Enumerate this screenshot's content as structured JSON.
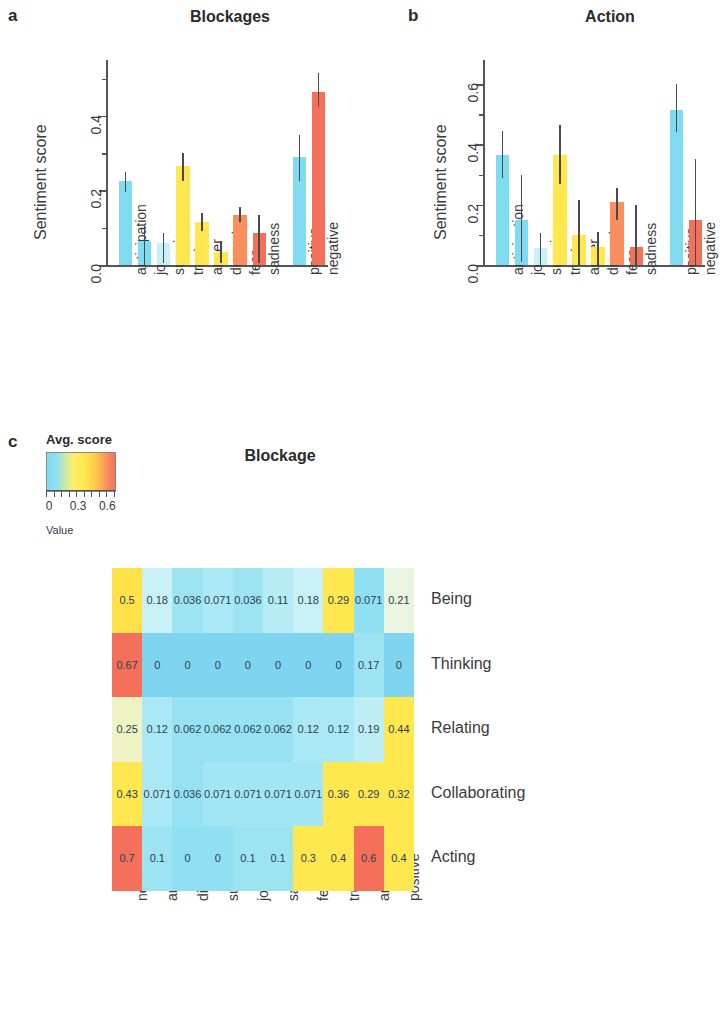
{
  "figure": {
    "panels": [
      {
        "letter": "a",
        "title": "Blockages"
      },
      {
        "letter": "b",
        "title": "Action"
      },
      {
        "letter": "c",
        "title": "Blockage"
      }
    ]
  },
  "panel_a": {
    "letter": "a",
    "title": "Blockages",
    "ylabel": "Sentiment score",
    "yticks": [
      "0.0",
      "0.2",
      "0.4"
    ]
  },
  "panel_b": {
    "letter": "b",
    "title": "Action",
    "ylabel": "Sentiment score",
    "yticks": [
      "0.0",
      "0.2",
      "0.4",
      "0.6"
    ]
  },
  "panel_c": {
    "letter": "c",
    "title": "Blockage",
    "legend": {
      "title": "Avg. score",
      "value_label": "Value",
      "ticks": [
        "0",
        "0.3",
        "0.6"
      ]
    },
    "colors": {
      "cyan": "#7fdcf0",
      "pale_cyan": "#c9f0f7",
      "yellow": "#ffe84f",
      "pale_yellow": "#f2f7c8",
      "orange": "#fa8e5e",
      "red": "#f4705a"
    }
  },
  "chart_data": [
    {
      "type": "bar",
      "panel": "a",
      "title": "Blockages",
      "xlabel": "",
      "ylabel": "Sentiment score",
      "ylim": [
        0,
        0.55
      ],
      "yticks": [
        0.0,
        0.2,
        0.4
      ],
      "grid": false,
      "legend": "none",
      "categories": [
        "anticipation",
        "joy",
        "surprise",
        "trust",
        "anger",
        "disgust",
        "fear",
        "sadness",
        "positive",
        "negative"
      ],
      "values": [
        0.225,
        0.065,
        0.06,
        0.265,
        0.115,
        0.035,
        0.135,
        0.085,
        0.29,
        0.465
      ],
      "err_low": [
        0.195,
        0.0,
        0.005,
        0.225,
        0.09,
        0.005,
        0.115,
        0.005,
        0.225,
        0.425
      ],
      "err_high": [
        0.25,
        0.105,
        0.085,
        0.3,
        0.14,
        0.065,
        0.155,
        0.135,
        0.35,
        0.515
      ],
      "bar_colors": [
        "#7fdcf0",
        "#7fdcf0",
        "#c9f0f7",
        "#ffe84f",
        "#ffe84f",
        "#ffe84f",
        "#fa8e5e",
        "#f4705a",
        "#7fdcf0",
        "#f4705a"
      ]
    },
    {
      "type": "bar",
      "panel": "b",
      "title": "Action",
      "xlabel": "",
      "ylabel": "Sentiment score",
      "ylim": [
        0,
        0.68
      ],
      "yticks": [
        0.0,
        0.2,
        0.4,
        0.6
      ],
      "grid": false,
      "legend": "none",
      "categories": [
        "anticipation",
        "joy",
        "surprise",
        "trust",
        "anger",
        "disgust",
        "fear",
        "sadness",
        "positive",
        "negative"
      ],
      "values": [
        0.365,
        0.15,
        0.055,
        0.365,
        0.1,
        0.06,
        0.21,
        0.06,
        0.515,
        0.15
      ],
      "err_low": [
        0.29,
        0.01,
        0.0,
        0.27,
        0.0,
        0.0,
        0.15,
        0.0,
        0.44,
        0.0
      ],
      "err_high": [
        0.445,
        0.3,
        0.105,
        0.465,
        0.215,
        0.11,
        0.255,
        0.2,
        0.6,
        0.35
      ],
      "bar_colors": [
        "#7fdcf0",
        "#7fdcf0",
        "#c9f0f7",
        "#ffe84f",
        "#ffe84f",
        "#ffe84f",
        "#fa8e5e",
        "#f4705a",
        "#7fdcf0",
        "#f4705a"
      ]
    },
    {
      "type": "heatmap",
      "panel": "c",
      "title": "Blockage",
      "colorbar_title": "Avg. score",
      "colorbar_label": "Value",
      "colorbar_ticks": [
        0,
        0.3,
        0.6
      ],
      "zlim": [
        0,
        0.7
      ],
      "columns": [
        "negative",
        "anger",
        "disgust",
        "surprise",
        "joy",
        "sadness",
        "fear",
        "trust",
        "anticipation",
        "positive"
      ],
      "rows": [
        "Being",
        "Thinking",
        "Relating",
        "Collaborating",
        "Acting"
      ],
      "values": [
        [
          0.5,
          0.18,
          0.036,
          0.071,
          0.036,
          0.11,
          0.18,
          0.29,
          0.071,
          0.21
        ],
        [
          0.67,
          0,
          0,
          0,
          0,
          0,
          0,
          0,
          0.17,
          0
        ],
        [
          0.25,
          0.12,
          0.062,
          0.062,
          0.062,
          0.062,
          0.12,
          0.12,
          0.19,
          0.44
        ],
        [
          0.43,
          0.071,
          0.036,
          0.071,
          0.071,
          0.071,
          0.071,
          0.36,
          0.29,
          0.32
        ],
        [
          0.7,
          0.1,
          0,
          0,
          0.1,
          0.1,
          0.3,
          0.4,
          0.6,
          0.4
        ]
      ],
      "labels": [
        [
          "0.5",
          "0.18",
          "0.036",
          "0.071",
          "0.036",
          "0.11",
          "0.18",
          "0.29",
          "0.071",
          "0.21"
        ],
        [
          "0.67",
          "0",
          "0",
          "0",
          "0",
          "0",
          "0",
          "0",
          "0.17",
          "0"
        ],
        [
          "0.25",
          "0.12",
          "0.062",
          "0.062",
          "0.062",
          "0.062",
          "0.12",
          "0.12",
          "0.19",
          "0.44"
        ],
        [
          "0.43",
          "0.071",
          "0.036",
          "0.071",
          "0.071",
          "0.071",
          "0.071",
          "0.36",
          "0.29",
          "0.32"
        ],
        [
          "0.7",
          "0.1",
          "0",
          "0",
          "0.1",
          "0.1",
          "0.3",
          "0.4",
          "0.6",
          "0.4"
        ]
      ],
      "cell_colors": [
        [
          "#ffe14a",
          "#c9f0f7",
          "#9ce4f2",
          "#a9e8f4",
          "#9ce4f2",
          "#b5ecf6",
          "#c9f0f7",
          "#ffe84f",
          "#8fe0f2",
          "#e9f5e0"
        ],
        [
          "#f4705a",
          "#7fd4ef",
          "#7fd4ef",
          "#7fd4ef",
          "#7fd4ef",
          "#7fd4ef",
          "#7fd4ef",
          "#7fd4ef",
          "#9ce4f2",
          "#7fd4ef"
        ],
        [
          "#eef3c4",
          "#a9e8f4",
          "#96e2f2",
          "#96e2f2",
          "#96e2f2",
          "#96e2f2",
          "#a9e8f4",
          "#a9e8f4",
          "#bdeef6",
          "#ffe84f"
        ],
        [
          "#ffe84f",
          "#a9e8f4",
          "#96e2f2",
          "#a2e6f3",
          "#a2e6f3",
          "#a2e6f3",
          "#a2e6f3",
          "#ffe84f",
          "#ffe84f",
          "#ffe84f"
        ],
        [
          "#f4705a",
          "#9ce4f2",
          "#8fe0f2",
          "#8fe0f2",
          "#9ce4f2",
          "#9ce4f2",
          "#ffe84f",
          "#ffe84f",
          "#f4705a",
          "#ffe84f"
        ]
      ]
    }
  ]
}
